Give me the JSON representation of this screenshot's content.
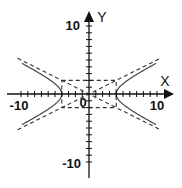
{
  "figure": {
    "title": "",
    "type": "hyperbola",
    "equation_implied": "x^2/16 - y^2/4 = 1"
  },
  "axes": {
    "x_label": "X",
    "y_label": "Y",
    "x_range": [
      -10,
      10
    ],
    "y_range": [
      -10,
      10
    ],
    "tick_step": 1,
    "tick_labels": {
      "x_neg": "-10",
      "x_pos": "10",
      "y_pos": "10",
      "y_neg": "-10",
      "origin": "0"
    }
  },
  "hyperbola": {
    "a": 4,
    "b": 2,
    "orientation": "horizontal",
    "center": [
      0,
      0
    ],
    "x_extent": 10
  },
  "asymptotes": {
    "slopes": [
      0.5,
      -0.5
    ],
    "style": "dashed",
    "x_extent": 10.5
  },
  "central_rectangle": {
    "x": [
      -4,
      4
    ],
    "y": [
      -2,
      2
    ],
    "style": "dashed"
  },
  "colors": {
    "axis": "#111111",
    "curve": "#444444",
    "dashed": "#333333",
    "background": "#ffffff"
  },
  "chart_data": {
    "type": "line",
    "title": "",
    "xlabel": "X",
    "ylabel": "Y",
    "xlim": [
      -10,
      10
    ],
    "ylim": [
      -10,
      10
    ],
    "grid": false,
    "series": [
      {
        "name": "hyperbola right branch",
        "x": [
          4,
          5,
          6,
          7,
          8,
          9,
          10
        ],
        "y_upper": [
          0,
          1.5,
          2.24,
          2.87,
          3.46,
          4.03,
          4.58
        ],
        "y_lower": [
          0,
          -1.5,
          -2.24,
          -2.87,
          -3.46,
          -4.03,
          -4.58
        ]
      },
      {
        "name": "hyperbola left branch",
        "x": [
          -4,
          -5,
          -6,
          -7,
          -8,
          -9,
          -10
        ],
        "y_upper": [
          0,
          1.5,
          2.24,
          2.87,
          3.46,
          4.03,
          4.58
        ],
        "y_lower": [
          0,
          -1.5,
          -2.24,
          -2.87,
          -3.46,
          -4.03,
          -4.58
        ]
      },
      {
        "name": "asymptote y = x/2",
        "x": [
          -10.5,
          10.5
        ],
        "y": [
          -5.25,
          5.25
        ]
      },
      {
        "name": "asymptote y = -x/2",
        "x": [
          -10.5,
          10.5
        ],
        "y": [
          5.25,
          -5.25
        ]
      }
    ]
  }
}
